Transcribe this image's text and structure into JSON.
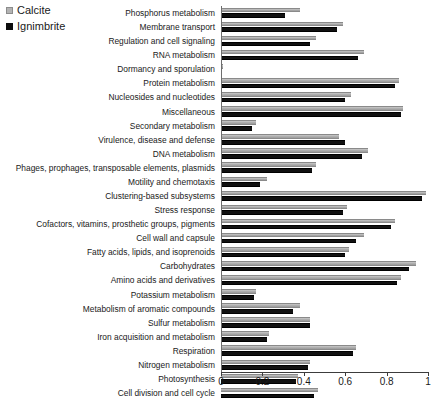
{
  "legend": {
    "position": "top-left",
    "entries": [
      {
        "label": "Calcite",
        "color": "#b3b3b3",
        "icon": "square-swatch"
      },
      {
        "label": "Ignimbrite",
        "color": "#111111",
        "icon": "square-swatch"
      }
    ]
  },
  "chart_data": {
    "type": "bar",
    "orientation": "horizontal",
    "title": "",
    "subtitle": "",
    "xlabel": "",
    "ylabel": "",
    "xlim": [
      0,
      1
    ],
    "xticks": [
      "0",
      "0.2",
      "0.4",
      "0.6",
      "0.8",
      "1"
    ],
    "xtick_values": [
      0,
      0.2,
      0.4,
      0.6,
      0.8,
      1
    ],
    "grid": false,
    "categories": [
      "Phosphorus metabolism",
      "Membrane transport",
      "Regulation and cell signaling",
      "RNA metabolism",
      "Dormancy and sporulation",
      "Protein metabolism",
      "Nucleosides and nucleotides",
      "Miscellaneous",
      "Secondary metabolism",
      "Virulence, disease and defense",
      "DNA metabolism",
      "Phages, prophages, transposable elements, plasmids",
      "Motility and chemotaxis",
      "Clustering-based subsystems",
      "Stress response",
      "Cofactors, vitamins, prosthetic groups, pigments",
      "Cell wall and capsule",
      "Fatty acids, lipids, and isoprenoids",
      "Carbohydrates",
      "Amino acids and derivatives",
      "Potassium metabolism",
      "Metabolism of aromatic compounds",
      "Sulfur metabolism",
      "Iron acquisition and metabolism",
      "Respiration",
      "Nitrogen metabolism",
      "Photosynthesis",
      "Cell division and cell cycle"
    ],
    "series": [
      {
        "name": "Calcite",
        "color": "#b3b3b3",
        "values": [
          0.38,
          0.59,
          0.46,
          0.69,
          0.01,
          0.86,
          0.63,
          0.88,
          0.17,
          0.57,
          0.71,
          0.46,
          0.22,
          0.99,
          0.61,
          0.84,
          0.69,
          0.62,
          0.94,
          0.87,
          0.17,
          0.38,
          0.43,
          0.23,
          0.65,
          0.43,
          0.37,
          0.47
        ]
      },
      {
        "name": "Ignimbrite",
        "color": "#111111",
        "values": [
          0.31,
          0.56,
          0.43,
          0.66,
          0.0,
          0.84,
          0.6,
          0.87,
          0.15,
          0.6,
          0.68,
          0.44,
          0.19,
          0.97,
          0.59,
          0.82,
          0.65,
          0.6,
          0.91,
          0.85,
          0.16,
          0.35,
          0.43,
          0.22,
          0.64,
          0.42,
          0.36,
          0.45
        ]
      }
    ]
  }
}
